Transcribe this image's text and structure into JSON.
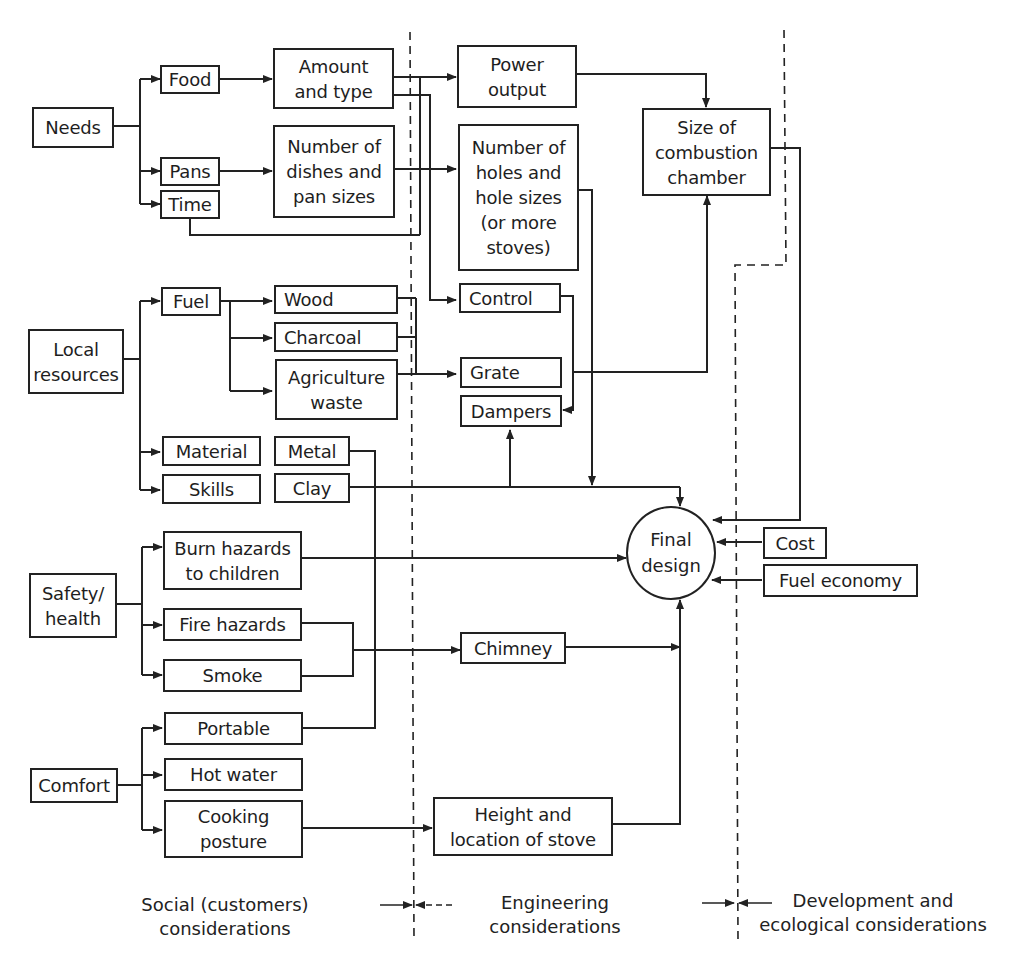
{
  "diagram": {
    "boxes": {
      "needs": "Needs",
      "food": "Food",
      "pans": "Pans",
      "time": "Time",
      "amount_type": "Amount\nand type",
      "dishes_pan_sizes": "Number of\ndishes and\npan sizes",
      "power_output": "Power\noutput",
      "holes": "Number of\nholes and\nhole sizes\n(or more\nstoves)",
      "combustion": "Size of\ncombustion\nchamber",
      "local_resources": "Local\nresources",
      "fuel": "Fuel",
      "wood": "Wood",
      "charcoal": "Charcoal",
      "agri_waste": "Agriculture\nwaste",
      "control": "Control",
      "grate": "Grate",
      "dampers": "Dampers",
      "material": "Material",
      "skills": "Skills",
      "metal": "Metal",
      "clay": "Clay",
      "safety_health": "Safety/\nhealth",
      "burn_hazards": "Burn hazards\nto children",
      "fire_hazards": "Fire hazards",
      "smoke": "Smoke",
      "chimney": "Chimney",
      "comfort": "Comfort",
      "portable": "Portable",
      "hot_water": "Hot water",
      "cooking_posture": "Cooking\nposture",
      "height_location": "Height and\nlocation of stove",
      "cost": "Cost",
      "fuel_economy": "Fuel economy"
    },
    "center": {
      "final_design": "Final\ndesign"
    },
    "zones": {
      "social": "Social (customers)\nconsiderations",
      "engineering": "Engineering\nconsiderations",
      "development": "Development and\necological considerations"
    },
    "colors": {
      "line": "#222222",
      "background": "#ffffff"
    }
  }
}
